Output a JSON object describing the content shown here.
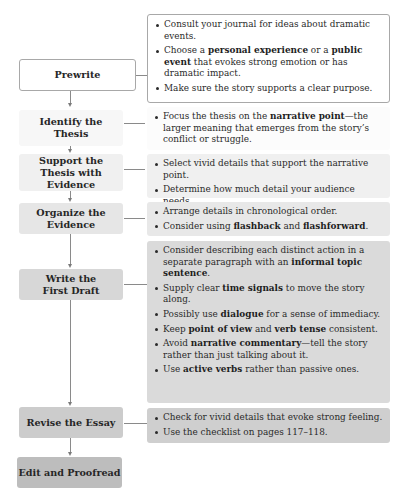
{
  "diagram": {
    "type": "flowchart",
    "direction": "top-to-bottom",
    "steps": [
      {
        "label": "Prewrite",
        "fill": "#ffffff",
        "details": [
          [
            {
              "t": "Consult your journal for ideas about dramatic events."
            }
          ],
          [
            {
              "t": "Choose a "
            },
            {
              "t": "personal experience",
              "b": true
            },
            {
              "t": " or a "
            },
            {
              "t": "public event",
              "b": true
            },
            {
              "t": " that evokes strong emotion or has dramatic impact."
            }
          ],
          [
            {
              "t": "Make sure the story supports a clear purpose."
            }
          ]
        ]
      },
      {
        "label": "Identify the Thesis",
        "fill": "#f7f7f7",
        "details": [
          [
            {
              "t": "Focus the thesis on the "
            },
            {
              "t": "narrative point",
              "b": true
            },
            {
              "t": "—the larger meaning that emerges from the story’s conflict or struggle."
            }
          ]
        ]
      },
      {
        "label": "Support the Thesis with Evidence",
        "fill": "#f0f0f0",
        "details": [
          [
            {
              "t": "Select vivid details that support the narrative point."
            }
          ],
          [
            {
              "t": "Determine how much detail your audience needs."
            }
          ],
          [
            {
              "t": "Possibly use "
            },
            {
              "t": "dramatic license",
              "b": true
            },
            {
              "t": "."
            }
          ]
        ]
      },
      {
        "label": "Organize the Evidence",
        "fill": "#e6e6e6",
        "details": [
          [
            {
              "t": "Arrange details in chronological order."
            }
          ],
          [
            {
              "t": "Consider using "
            },
            {
              "t": "flashback",
              "b": true
            },
            {
              "t": " and "
            },
            {
              "t": "flashforward",
              "b": true
            },
            {
              "t": "."
            }
          ]
        ]
      },
      {
        "label": "Write the First Draft",
        "fill": "#d7d7d7",
        "details": [
          [
            {
              "t": "Consider describing each distinct action in a separate paragraph with an "
            },
            {
              "t": "informal topic sentence",
              "b": true
            },
            {
              "t": "."
            }
          ],
          [
            {
              "t": "Supply clear "
            },
            {
              "t": "time signals",
              "b": true
            },
            {
              "t": " to move the story along."
            }
          ],
          [
            {
              "t": "Possibly use "
            },
            {
              "t": "dialogue",
              "b": true
            },
            {
              "t": " for a sense of immediacy."
            }
          ],
          [
            {
              "t": "Keep "
            },
            {
              "t": "point of view",
              "b": true
            },
            {
              "t": " and "
            },
            {
              "t": "verb tense",
              "b": true
            },
            {
              "t": " consistent."
            }
          ],
          [
            {
              "t": "Avoid "
            },
            {
              "t": "narrative commentary",
              "b": true
            },
            {
              "t": "—tell the story rather than just talking about it."
            }
          ],
          [
            {
              "t": "Use "
            },
            {
              "t": "active verbs",
              "b": true
            },
            {
              "t": " rather than passive ones."
            }
          ]
        ]
      },
      {
        "label": "Revise the Essay",
        "fill": "#cccccc",
        "details": [
          [
            {
              "t": "Check for vivid details that evoke strong feeling."
            }
          ],
          [
            {
              "t": "Use the checklist on pages 117–118."
            }
          ]
        ]
      },
      {
        "label": "Edit and Proofread",
        "fill": "#bdbdbd",
        "details": []
      }
    ]
  },
  "colors": {
    "border": "#a8a8a8",
    "connector": "#8a8a8a",
    "text": "#2a2a2a"
  }
}
